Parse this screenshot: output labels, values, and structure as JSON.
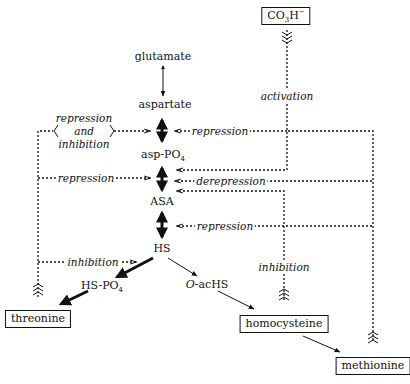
{
  "metabolites": {
    "glutamate": "glutamate",
    "aspartate": "aspartate",
    "asp_po4": "asp-PO",
    "asp_po4_sub": "4",
    "asa": "ASA",
    "hs": "HS",
    "hs_po4": "HS-PO",
    "hs_po4_sub": "4",
    "o_achs_prefix": "O",
    "o_achs": "-acHS"
  },
  "end_products": {
    "threonine": "threonine",
    "homocysteine": "homocysteine",
    "methionine": "methionine",
    "co3h": "CO",
    "co3h_sub": "3",
    "co3h_h": "H",
    "co3h_sup": "−"
  },
  "regulation_labels": {
    "repression_and_inhibition_1": "repression",
    "repression_and_inhibition_2": "and",
    "repression_and_inhibition_3": "inhibition",
    "threonine_repression": "repression",
    "threonine_inhibition": "inhibition",
    "activation": "activation",
    "methionine_repression_top": "repression",
    "derepression": "derepression",
    "methionine_repression_asa": "repression",
    "homocysteine_inhibition": "inhibition"
  },
  "colors": {
    "ink": "#111111",
    "background": "#ffffff"
  }
}
